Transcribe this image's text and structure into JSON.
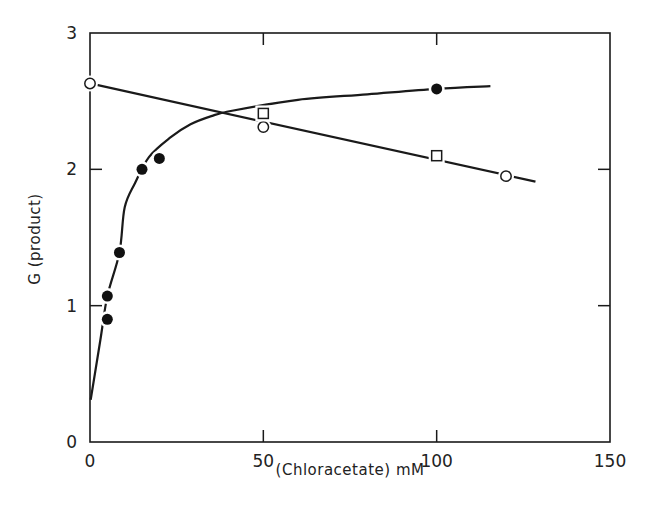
{
  "chart_data": {
    "type": "scatter",
    "title": "",
    "xlabel": "(Chloracetate)  mM",
    "ylabel": "G  (product)",
    "xlim": [
      0,
      150
    ],
    "ylim": [
      0,
      3
    ],
    "xticks": [
      0,
      50,
      100,
      150
    ],
    "yticks": [
      0,
      1,
      2,
      3
    ],
    "xtick_labels": [
      "0",
      "50",
      "100",
      "150"
    ],
    "ytick_labels": [
      "0",
      "1",
      "2",
      "3"
    ],
    "grid": false,
    "legend": null,
    "series": [
      {
        "name": "filled circles",
        "marker": "filled-circle",
        "points": [
          {
            "x": 5,
            "y": 0.9
          },
          {
            "x": 5,
            "y": 1.07
          },
          {
            "x": 8.5,
            "y": 1.39
          },
          {
            "x": 15,
            "y": 2.0
          },
          {
            "x": 20,
            "y": 2.08
          },
          {
            "x": 100,
            "y": 2.59
          }
        ],
        "fit": "saturating curve",
        "fit_curve": [
          {
            "x": 0.2,
            "y": 0.31
          },
          {
            "x": 3,
            "y": 0.75
          },
          {
            "x": 5,
            "y": 1.07
          },
          {
            "x": 8.5,
            "y": 1.39
          },
          {
            "x": 10,
            "y": 1.72
          },
          {
            "x": 13,
            "y": 1.9
          },
          {
            "x": 17,
            "y": 2.09
          },
          {
            "x": 23,
            "y": 2.23
          },
          {
            "x": 29,
            "y": 2.33
          },
          {
            "x": 35,
            "y": 2.39
          },
          {
            "x": 41,
            "y": 2.43
          },
          {
            "x": 60,
            "y": 2.51
          },
          {
            "x": 80,
            "y": 2.55
          },
          {
            "x": 100,
            "y": 2.59
          },
          {
            "x": 115.5,
            "y": 2.61
          }
        ]
      },
      {
        "name": "open circles",
        "marker": "open-circle",
        "points": [
          {
            "x": 0,
            "y": 2.63
          },
          {
            "x": 50,
            "y": 2.31
          },
          {
            "x": 120,
            "y": 1.95
          }
        ]
      },
      {
        "name": "open squares",
        "marker": "open-square",
        "points": [
          {
            "x": 50,
            "y": 2.41
          },
          {
            "x": 100,
            "y": 2.1
          }
        ]
      }
    ],
    "lines": [
      {
        "name": "linear decrease",
        "from": {
          "x": 0,
          "y": 2.63
        },
        "to": {
          "x": 128.5,
          "y": 1.91
        }
      }
    ]
  }
}
